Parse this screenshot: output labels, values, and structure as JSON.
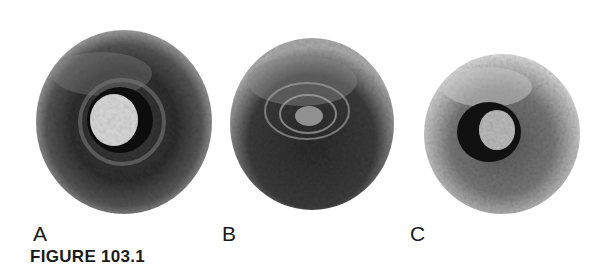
{
  "figure": {
    "caption": "FIGURE 103.1",
    "panels": [
      {
        "label": "A",
        "description": "dark circular lesion with bright central core surrounded by black ring"
      },
      {
        "label": "B",
        "description": "dark circular lesion with concentric swirled center"
      },
      {
        "label": "C",
        "description": "smaller lighter lesion with dark eccentric core"
      }
    ]
  },
  "colors": {
    "background": "#ffffff",
    "ink": "#1a1a1a"
  }
}
